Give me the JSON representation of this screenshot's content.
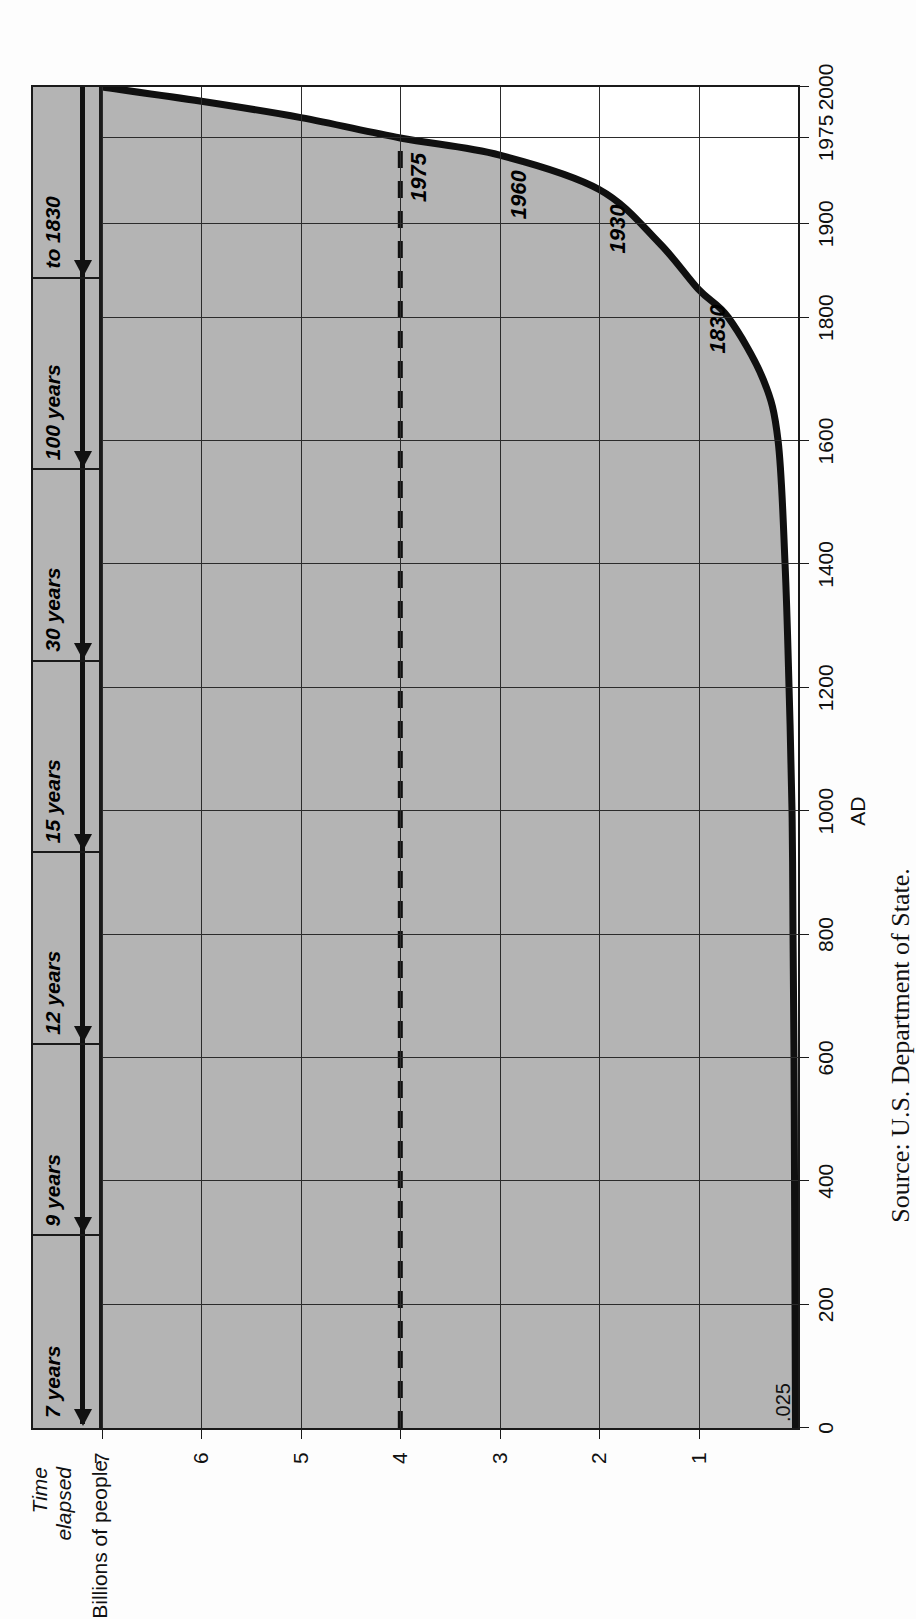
{
  "chart_data": {
    "type": "line",
    "title": "",
    "xlabel": "AD",
    "ylabel": "Billions of people",
    "xlim": [
      0,
      2000
    ],
    "ylim": [
      0,
      7
    ],
    "grid": true,
    "legend": null,
    "x_ticks": [
      {
        "value": 0,
        "label": "0"
      },
      {
        "value": 200,
        "label": "200"
      },
      {
        "value": 400,
        "label": "400"
      },
      {
        "value": 600,
        "label": "600"
      },
      {
        "value": 800,
        "label": "800"
      },
      {
        "value": 1000,
        "label": "1000"
      },
      {
        "value": 1200,
        "label": "1200"
      },
      {
        "value": 1400,
        "label": "1400"
      },
      {
        "value": 1600,
        "label": "1600"
      },
      {
        "value": 1800,
        "label": "1800"
      },
      {
        "value": 1900,
        "label": "1900"
      },
      {
        "value": 1975,
        "label": "1975"
      },
      {
        "value": 2000,
        "label": "2000"
      }
    ],
    "y_ticks": [
      {
        "value": 1,
        "label": "1"
      },
      {
        "value": 2,
        "label": "2"
      },
      {
        "value": 3,
        "label": "3"
      },
      {
        "value": 4,
        "label": "4"
      },
      {
        "value": 5,
        "label": "5"
      },
      {
        "value": 6,
        "label": "6"
      },
      {
        "value": 7,
        "label": "7"
      }
    ],
    "origin_note": ".025",
    "series": [
      {
        "name": "World population",
        "style": "solid",
        "points": [
          {
            "x": 0,
            "y": 0.025
          },
          {
            "x": 200,
            "y": 0.03
          },
          {
            "x": 400,
            "y": 0.035
          },
          {
            "x": 600,
            "y": 0.04
          },
          {
            "x": 800,
            "y": 0.05
          },
          {
            "x": 1000,
            "y": 0.06
          },
          {
            "x": 1200,
            "y": 0.09
          },
          {
            "x": 1400,
            "y": 0.13
          },
          {
            "x": 1600,
            "y": 0.2
          },
          {
            "x": 1700,
            "y": 0.35
          },
          {
            "x": 1800,
            "y": 0.7
          },
          {
            "x": 1830,
            "y": 1.0
          },
          {
            "x": 1880,
            "y": 1.4
          },
          {
            "x": 1930,
            "y": 2.0
          },
          {
            "x": 1960,
            "y": 3.0
          },
          {
            "x": 1975,
            "y": 4.0
          },
          {
            "x": 1985,
            "y": 5.0
          },
          {
            "x": 1993,
            "y": 6.0
          },
          {
            "x": 2000,
            "y": 7.0
          }
        ]
      },
      {
        "name": "Projection reference level",
        "style": "dashed",
        "points": [
          {
            "x": 0,
            "y": 4.0
          },
          {
            "x": 1975,
            "y": 4.0
          }
        ]
      }
    ],
    "annotations": [
      {
        "label": "1830",
        "x": 1830,
        "y": 1
      },
      {
        "label": "1930",
        "x": 1930,
        "y": 2
      },
      {
        "label": "1960",
        "x": 1960,
        "y": 3
      },
      {
        "label": "1975",
        "x": 1975,
        "y": 4
      }
    ],
    "time_elapsed_band": {
      "title_line1": "Time",
      "title_line2": "elapsed",
      "segments": [
        {
          "label": "to 1830",
          "from_billions": 0,
          "to_billions": 1
        },
        {
          "label": "100 years",
          "from_billions": 1,
          "to_billions": 2
        },
        {
          "label": "30 years",
          "from_billions": 2,
          "to_billions": 3
        },
        {
          "label": "15 years",
          "from_billions": 3,
          "to_billions": 4
        },
        {
          "label": "12 years",
          "from_billions": 4,
          "to_billions": 5
        },
        {
          "label": "9 years",
          "from_billions": 5,
          "to_billions": 6
        },
        {
          "label": "7 years",
          "from_billions": 6,
          "to_billions": 7
        }
      ]
    },
    "source": "Source:  U.S. Department of State."
  },
  "colors": {
    "curve": "#101010",
    "band_fill": "#b4b4b4",
    "shade_fill": "#b4b4b4",
    "frame": "#1a1a1a",
    "grid": "#2b2b2b",
    "text": "#111111"
  }
}
